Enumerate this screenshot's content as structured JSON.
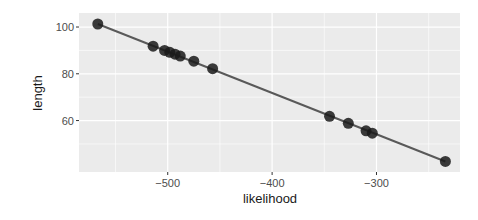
{
  "chart_data": {
    "type": "scatter",
    "title": "",
    "xlabel": "likelihood",
    "ylabel": "length",
    "xlim": [
      -585,
      -220
    ],
    "ylim": [
      38,
      106
    ],
    "x_ticks": [
      -500,
      -400,
      -300
    ],
    "y_ticks": [
      60,
      80,
      100
    ],
    "x_tick_labels": [
      "-500",
      "-400",
      "-300"
    ],
    "y_tick_labels": [
      "60",
      "80",
      "100"
    ],
    "grid": true,
    "legend": "none",
    "points": [
      {
        "x": -567,
        "y": 101.3
      },
      {
        "x": -514,
        "y": 91.8
      },
      {
        "x": -503,
        "y": 90.0
      },
      {
        "x": -498,
        "y": 89.2
      },
      {
        "x": -493,
        "y": 88.4
      },
      {
        "x": -488,
        "y": 87.6
      },
      {
        "x": -475,
        "y": 85.4
      },
      {
        "x": -457,
        "y": 82.2
      },
      {
        "x": -345,
        "y": 61.8
      },
      {
        "x": -327,
        "y": 58.8
      },
      {
        "x": -310,
        "y": 55.6
      },
      {
        "x": -304,
        "y": 54.6
      },
      {
        "x": -234,
        "y": 42.5
      }
    ],
    "fit_line": {
      "x": [
        -567,
        -234
      ],
      "y": [
        101.3,
        42.5
      ]
    },
    "colors": {
      "panel_background": "#ebebeb",
      "grid": "#ffffff",
      "point": "#1a1a1a",
      "line": "#595959"
    }
  }
}
